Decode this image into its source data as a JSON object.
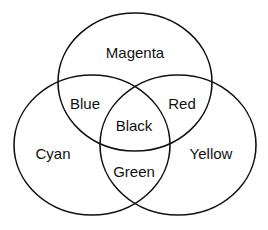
{
  "diagram": {
    "type": "venn",
    "sets": [
      {
        "name": "Magenta",
        "cx": 135,
        "cy": 82,
        "rx": 77,
        "ry": 69
      },
      {
        "name": "Cyan",
        "cx": 92,
        "cy": 145,
        "rx": 78,
        "ry": 70
      },
      {
        "name": "Yellow",
        "cx": 178,
        "cy": 145,
        "rx": 78,
        "ry": 70
      }
    ],
    "regions": {
      "magenta": "Magenta",
      "cyan": "Cyan",
      "yellow": "Yellow",
      "blue": "Blue",
      "red": "Red",
      "green": "Green",
      "black": "Black"
    },
    "colors": {
      "stroke": "#111111",
      "background": "#ffffff"
    }
  }
}
